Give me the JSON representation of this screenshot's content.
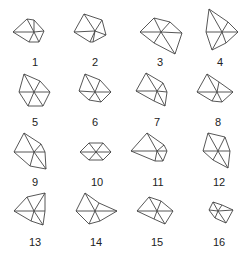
{
  "figure": {
    "stroke_color": "#444444",
    "label_color": "#222222",
    "shapes": [
      {
        "label": "1",
        "cx": 34,
        "cy": 32,
        "pts": [
          [
            13,
            32
          ],
          [
            27,
            19
          ],
          [
            34,
            20
          ],
          [
            44,
            31
          ],
          [
            39,
            42
          ],
          [
            29,
            42
          ]
        ],
        "lx": 35,
        "ly": 66
      },
      {
        "label": "2",
        "cx": 95,
        "cy": 31,
        "pts": [
          [
            74,
            32
          ],
          [
            84,
            14
          ],
          [
            102,
            20
          ],
          [
            106,
            35
          ],
          [
            93,
            42
          ],
          [
            90,
            42
          ]
        ],
        "lx": 95,
        "ly": 66
      },
      {
        "label": "3",
        "cx": 161,
        "cy": 32,
        "pts": [
          [
            140,
            32
          ],
          [
            154,
            18
          ],
          [
            170,
            22
          ],
          [
            182,
            33
          ],
          [
            175,
            54
          ],
          [
            154,
            43
          ]
        ],
        "lx": 160,
        "ly": 66
      },
      {
        "label": "4",
        "cx": 222,
        "cy": 32,
        "pts": [
          [
            206,
            32
          ],
          [
            209,
            9
          ],
          [
            228,
            22
          ],
          [
            238,
            32
          ],
          [
            226,
            43
          ],
          [
            212,
            50
          ]
        ],
        "lx": 220,
        "ly": 66
      },
      {
        "label": "5",
        "cx": 34,
        "cy": 92,
        "pts": [
          [
            19,
            92
          ],
          [
            24,
            74
          ],
          [
            40,
            81
          ],
          [
            50,
            92
          ],
          [
            43,
            106
          ],
          [
            28,
            106
          ]
        ],
        "lx": 35,
        "ly": 126
      },
      {
        "label": "6",
        "cx": 95,
        "cy": 92,
        "pts": [
          [
            79,
            91
          ],
          [
            85,
            74
          ],
          [
            100,
            80
          ],
          [
            111,
            92
          ],
          [
            101,
            102
          ],
          [
            89,
            100
          ]
        ],
        "lx": 95,
        "ly": 126
      },
      {
        "label": "7",
        "cx": 157,
        "cy": 91,
        "pts": [
          [
            136,
            91
          ],
          [
            146,
            73
          ],
          [
            163,
            83
          ],
          [
            167,
            92
          ],
          [
            165,
            106
          ],
          [
            154,
            101
          ]
        ],
        "lx": 157,
        "ly": 126
      },
      {
        "label": "8",
        "cx": 217,
        "cy": 92,
        "pts": [
          [
            197,
            92
          ],
          [
            207,
            74
          ],
          [
            219,
            82
          ],
          [
            233,
            92
          ],
          [
            222,
            102
          ],
          [
            212,
            101
          ]
        ],
        "lx": 218,
        "ly": 126
      },
      {
        "label": "9",
        "cx": 34,
        "cy": 152,
        "pts": [
          [
            14,
            152
          ],
          [
            24,
            133
          ],
          [
            41,
            144
          ],
          [
            45,
            152
          ],
          [
            46,
            169
          ],
          [
            30,
            166
          ]
        ],
        "lx": 35,
        "ly": 186
      },
      {
        "label": "10",
        "cx": 96,
        "cy": 152,
        "pts": [
          [
            80,
            152
          ],
          [
            89,
            143
          ],
          [
            103,
            143
          ],
          [
            111,
            152
          ],
          [
            103,
            160
          ],
          [
            89,
            160
          ]
        ],
        "lx": 97,
        "ly": 186
      },
      {
        "label": "11",
        "cx": 157,
        "cy": 151,
        "pts": [
          [
            131,
            151
          ],
          [
            147,
            133
          ],
          [
            164,
            145
          ],
          [
            167,
            151
          ],
          [
            163,
            161
          ],
          [
            155,
            161
          ]
        ],
        "lx": 158,
        "ly": 186
      },
      {
        "label": "12",
        "cx": 218,
        "cy": 151,
        "pts": [
          [
            203,
            151
          ],
          [
            208,
            133
          ],
          [
            225,
            137
          ],
          [
            230,
            151
          ],
          [
            228,
            168
          ],
          [
            213,
            160
          ]
        ],
        "lx": 219,
        "ly": 186
      },
      {
        "label": "13",
        "cx": 34,
        "cy": 211,
        "pts": [
          [
            14,
            211
          ],
          [
            27,
            197
          ],
          [
            45,
            193
          ],
          [
            45,
            211
          ],
          [
            43,
            225
          ],
          [
            31,
            221
          ]
        ],
        "lx": 35,
        "ly": 246
      },
      {
        "label": "14",
        "cx": 95,
        "cy": 211,
        "pts": [
          [
            76,
            211
          ],
          [
            85,
            193
          ],
          [
            99,
            203
          ],
          [
            117,
            211
          ],
          [
            100,
            221
          ],
          [
            89,
            224
          ]
        ],
        "lx": 96,
        "ly": 246
      },
      {
        "label": "15",
        "cx": 157,
        "cy": 211,
        "pts": [
          [
            137,
            211
          ],
          [
            149,
            197
          ],
          [
            161,
            201
          ],
          [
            173,
            211
          ],
          [
            165,
            224
          ],
          [
            154,
            219
          ]
        ],
        "lx": 157,
        "ly": 246
      },
      {
        "label": "16",
        "cx": 218,
        "cy": 211,
        "pts": [
          [
            209,
            210
          ],
          [
            213,
            202
          ],
          [
            222,
            205
          ],
          [
            233,
            210
          ],
          [
            226,
            223
          ],
          [
            215,
            218
          ]
        ],
        "lx": 219,
        "ly": 246
      }
    ]
  }
}
